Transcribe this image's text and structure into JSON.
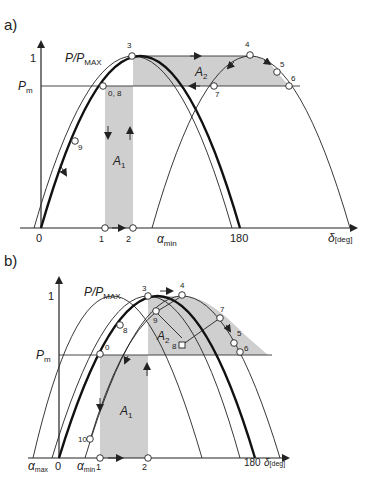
{
  "panels": [
    {
      "id": "a",
      "label": "a)",
      "y_axis_label": "P/P",
      "y_axis_sub": "MAX",
      "y_tick_one": "1",
      "pm_label": "P",
      "pm_sub": "m",
      "x_axis_label": "δ",
      "x_axis_unit": "[deg]",
      "x_ticks": [
        "0",
        "1",
        "2",
        "180"
      ],
      "alpha_min": "α",
      "alpha_min_sub": "min",
      "area1": "A",
      "area1_sub": "1",
      "area2": "A",
      "area2_sub": "2",
      "points": [
        "3",
        "0, 8",
        "9",
        "4",
        "5",
        "6",
        "7"
      ]
    },
    {
      "id": "b",
      "label": "b)",
      "y_axis_label": "P/P",
      "y_axis_sub": "MAX",
      "y_tick_one": "1",
      "pm_label": "P",
      "pm_sub": "m",
      "x_axis_label": "δ",
      "x_axis_unit": "[deg]",
      "x_ticks": [
        "0",
        "1",
        "2",
        "180"
      ],
      "alpha_max": "α",
      "alpha_max_sub": "max",
      "alpha_min": "α",
      "alpha_min_sub": "min",
      "area1": "A",
      "area1_sub": "1",
      "area2": "A",
      "area2_sub": "2",
      "points": [
        "3",
        "4",
        "9",
        "8",
        "7",
        "5",
        "6",
        "0",
        "8",
        "10"
      ]
    }
  ],
  "colors": {
    "shade": "#cfcfcf",
    "line": "#222222"
  }
}
